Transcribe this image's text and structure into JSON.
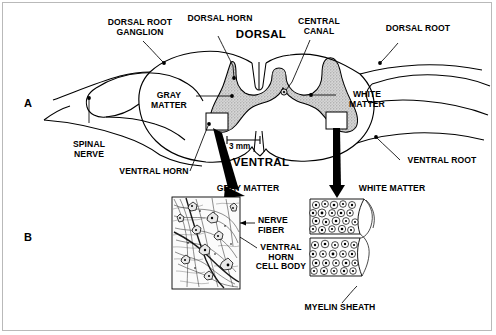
{
  "figure": {
    "panels": [
      {
        "letter": "A",
        "name": "spinal-cord-cross-section"
      },
      {
        "letter": "B",
        "name": "micrographs"
      }
    ]
  },
  "panel_a": {
    "labels": {
      "dorsal_root_ganglion": "DORSAL ROOT\nGANGLION",
      "dorsal_horn": "DORSAL HORN",
      "dorsal": "DORSAL",
      "central_canal": "CENTRAL\nCANAL",
      "dorsal_root": "DORSAL ROOT",
      "gray_matter": "GRAY\nMATTER",
      "white_matter": "WHITE\nMATTER",
      "spinal_nerve": "SPINAL\nNERVE",
      "ventral_horn": "VENTRAL HORN",
      "ventral": "VENTRAL",
      "ventral_root": "VENTRAL ROOT"
    },
    "scale_bar": "3 mm"
  },
  "panel_b": {
    "labels": {
      "gray_matter": "GRAY MATTER",
      "white_matter": "WHITE MATTER",
      "nerve_fiber": "NERVE\nFIBER",
      "ventral_horn_cell_body": "VENTRAL\nHORN\nCELL BODY",
      "myelin_sheath": "MYELIN SHEATH"
    }
  },
  "colors": {
    "ink": "#000000",
    "gray_matter_fill": "#c9c9c9",
    "frame": "#b9b9b9",
    "background": "#ffffff"
  }
}
